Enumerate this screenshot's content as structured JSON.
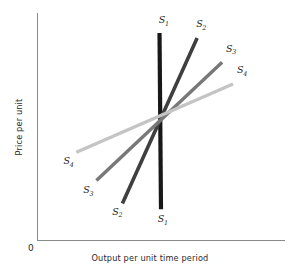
{
  "chart_data": {
    "type": "line",
    "title": "",
    "subtitle": "",
    "xlabel": "Output per unit time period",
    "ylabel": "Price per unit",
    "origin_label": "0",
    "grid": false,
    "legend": "none",
    "axis_ticks": [],
    "xlim": [
      0,
      100
    ],
    "ylim": [
      0,
      100
    ],
    "annotation": "Four supply curves of differing elasticity all passing through a common point",
    "intersection_point": {
      "x": 49.6,
      "y": 53.4
    },
    "series": [
      {
        "name": "S1",
        "label": "S",
        "subscript": "1",
        "color": "#181818",
        "width": 4.2,
        "description": "perfectly inelastic vertical supply curve",
        "points": [
          {
            "x": 49.3,
            "y": 91.2
          },
          {
            "x": 49.9,
            "y": 13.7
          }
        ],
        "label_top": {
          "x": 49.0,
          "y": 95.5
        },
        "label_bottom": {
          "x": 48.6,
          "y": 8.0
        }
      },
      {
        "name": "S2",
        "label": "S",
        "subscript": "2",
        "color": "#3f3f3f",
        "width": 3.6,
        "description": "steeply sloped relatively inelastic supply curve",
        "points": [
          {
            "x": 34.3,
            "y": 16.3
          },
          {
            "x": 64.5,
            "y": 89.0
          }
        ],
        "label_top": {
          "x": 64.1,
          "y": 93.8
        },
        "label_bottom": {
          "x": 30.2,
          "y": 11.4
        }
      },
      {
        "name": "S3",
        "label": "S",
        "subscript": "3",
        "color": "#787878",
        "width": 3.4,
        "description": "moderately sloped supply curve",
        "points": [
          {
            "x": 23.8,
            "y": 26.4
          },
          {
            "x": 74.6,
            "y": 78.4
          }
        ],
        "label_top": {
          "x": 76.2,
          "y": 83.0
        },
        "label_bottom": {
          "x": 18.5,
          "y": 20.8
        }
      },
      {
        "name": "S4",
        "label": "S",
        "subscript": "4",
        "color": "#c4c4c4",
        "width": 3.4,
        "description": "shallow relatively elastic supply curve",
        "points": [
          {
            "x": 15.7,
            "y": 38.8
          },
          {
            "x": 79.0,
            "y": 68.8
          }
        ],
        "label_top": {
          "x": 80.6,
          "y": 73.6
        },
        "label_bottom": {
          "x": 10.5,
          "y": 33.6
        }
      }
    ]
  },
  "axes": {
    "y_axis_title": "Price per unit",
    "x_axis_title": "Output per unit time period",
    "origin": "0"
  }
}
